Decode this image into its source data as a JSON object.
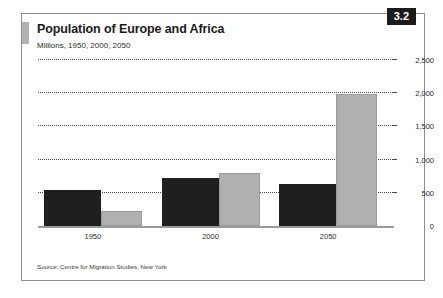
{
  "figure": {
    "badge": "3.2",
    "title": "Population of Europe and Africa",
    "subtitle": "Millions, 1950, 2000, 2050",
    "source": "Source: Centre for Migration Studies, New York",
    "colors": {
      "series_europe": "#1f1f1f",
      "series_africa": "#b0b0b0",
      "gridline": "#4a4a4a",
      "frame": "#8e8e8e",
      "badge_bg": "#1c1c1c",
      "accent_bar": "#b2b2b2"
    }
  },
  "chart_data": {
    "type": "bar",
    "title": "Population of Europe and Africa",
    "subtitle": "Millions, 1950, 2000, 2050",
    "xlabel": "",
    "ylabel": "",
    "unit": "Millions",
    "categories": [
      "1950",
      "2000",
      "2050"
    ],
    "series": [
      {
        "name": "Europe",
        "color": "#1f1f1f",
        "values": [
          547,
          729,
          632
        ]
      },
      {
        "name": "Africa",
        "color": "#b0b0b0",
        "values": [
          224,
          800,
          1985
        ]
      }
    ],
    "ylim": [
      0,
      2500
    ],
    "yticks": [
      0,
      500,
      1000,
      1500,
      2000,
      2500
    ],
    "ytick_labels": [
      "0",
      "500",
      "1,000",
      "1,500",
      "2,000",
      "2,500"
    ],
    "grid": true,
    "grid_style": "dotted",
    "legend": "none",
    "source": "Source: Centre for Migration Studies, New York"
  }
}
